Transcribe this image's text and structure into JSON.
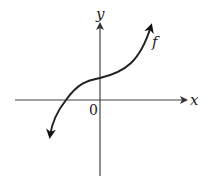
{
  "figure": {
    "x_axis_label": "x",
    "y_axis_label": "y",
    "origin_label": "0",
    "curve_label": "f"
  },
  "colors": {
    "axis": "#444444",
    "curve": "#222222",
    "background": "#ffffff"
  }
}
